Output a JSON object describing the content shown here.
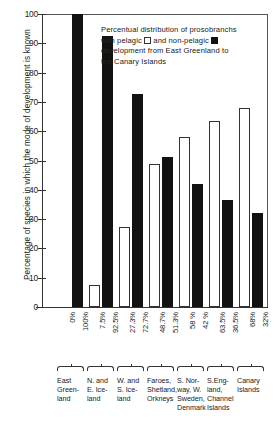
{
  "chart_data": {
    "type": "bar",
    "xlabel": "",
    "ylabel": "Percentage of species in which the mode of development is known",
    "ylim": [
      0,
      100
    ],
    "yticks": [
      0,
      10,
      20,
      30,
      40,
      50,
      60,
      70,
      80,
      90,
      100
    ],
    "ytick_labels": [
      "0",
      "10",
      "20",
      "30",
      "40",
      "50",
      "60",
      "70",
      "80",
      "90",
      "100"
    ],
    "grid": false,
    "legend": "inline-in-title",
    "categories": [
      "East Green-land",
      "N. and E. Ice-land",
      "W. and S. Ice-land",
      "Faroes, Shetland, Orkneys",
      "S. Nor-way, W. Sweden, Denmark",
      "S. Eng-land, Channel Islands",
      "Canary Islands"
    ],
    "series": [
      {
        "name": "pelagic",
        "color": "#ffffff",
        "values": [
          0,
          7.5,
          27.3,
          48.7,
          58,
          63.5,
          68
        ],
        "labels": [
          "0%",
          "7.5%",
          "27.3%",
          "48.7%",
          "58 %",
          "63.5%",
          "68%"
        ]
      },
      {
        "name": "non-pelagic",
        "color": "#121212",
        "values": [
          100,
          92.5,
          72.7,
          51.3,
          42,
          36.5,
          32
        ],
        "labels": [
          "100%",
          "92.5%",
          "72.7%",
          "51.3%",
          "42 %",
          "36.5%",
          "32%"
        ]
      }
    ]
  },
  "caption": {
    "line1_a": "Percentual distribution of prosobranchs",
    "line2_a": "with pelagic",
    "line2_b": "and non-pelagic",
    "line3": "development from East Greenland to",
    "line4": "the Canary Islands"
  },
  "axis": {
    "y_title": "Percentage of species in which the mode of development is known"
  },
  "regions": [
    {
      "lines": [
        "East",
        "Green-",
        "land"
      ]
    },
    {
      "lines": [
        "N. and",
        "E. Ice-",
        "land"
      ]
    },
    {
      "lines": [
        "W. and",
        "S. Ice-",
        "land"
      ]
    },
    {
      "lines": [
        "Faroes,",
        "Shetland,",
        "Orkneys"
      ]
    },
    {
      "lines": [
        "S. Nor-",
        "way, W.",
        "Sweden,",
        "Denmark"
      ]
    },
    {
      "lines": [
        "S.Eng-",
        "land,",
        "Channel",
        "Islands"
      ]
    },
    {
      "lines": [
        "Canary",
        "Islands"
      ]
    }
  ]
}
